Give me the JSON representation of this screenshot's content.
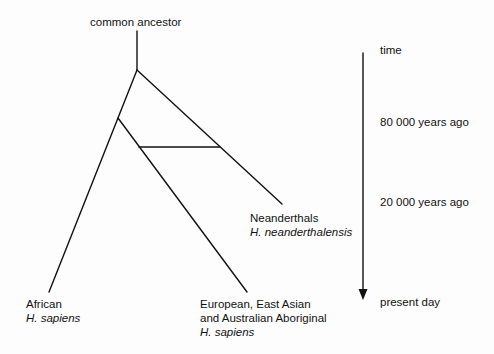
{
  "diagram": {
    "root_label": "common ancestor",
    "leaves": [
      {
        "name": "African",
        "species": "H. sapiens"
      },
      {
        "name_line1": "European, East Asian",
        "name_line2": "and Australian Aboriginal",
        "species": "H. sapiens"
      },
      {
        "name": "Neanderthals",
        "species": "H. neanderthalensis"
      }
    ],
    "interbreeding_link": "horizontal bar between Eurasian H. sapiens and Neanderthal lineages"
  },
  "time_axis": {
    "label": "time",
    "ticks": [
      {
        "label": "80 000 years ago"
      },
      {
        "label": "20 000 years ago"
      },
      {
        "label": "present day"
      }
    ],
    "direction": "down"
  },
  "colors": {
    "line": "#111111",
    "background": "#fdfdfd"
  }
}
